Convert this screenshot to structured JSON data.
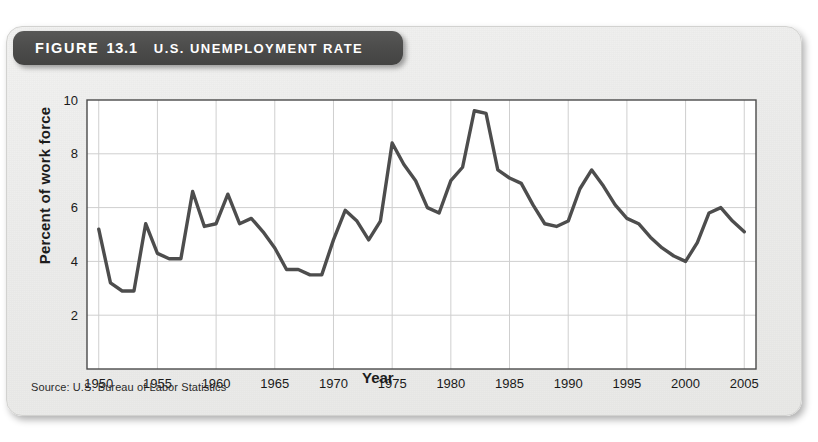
{
  "figure": {
    "banner_label": "FIGURE",
    "banner_number": "13.1",
    "banner_title": "U.S. UNEMPLOYMENT RATE",
    "source_note": "Source: U.S. Bureau of Labor Statistics",
    "banner_bg_color": "#4a4a49",
    "banner_text_color": "#ffffff",
    "card_bg_color": "#ececeb",
    "line_color": "#4d4d4d",
    "grid_color": "#cfcfcf",
    "axis_color": "#4a4a4a"
  },
  "chart_data": {
    "type": "line",
    "title": "U.S. UNEMPLOYMENT RATE",
    "xlabel": "Year",
    "ylabel": "Percent of work force",
    "xlim": [
      1949,
      2006
    ],
    "ylim": [
      0,
      10
    ],
    "yticks": [
      2,
      4,
      6,
      8,
      10
    ],
    "xticks": [
      1950,
      1955,
      1960,
      1965,
      1970,
      1975,
      1980,
      1985,
      1990,
      1995,
      2000,
      2005
    ],
    "grid": true,
    "legend": "none",
    "series": [
      {
        "name": "U.S. unemployment rate",
        "x": [
          1950,
          1951,
          1952,
          1953,
          1954,
          1955,
          1956,
          1957,
          1958,
          1959,
          1960,
          1961,
          1962,
          1963,
          1964,
          1965,
          1966,
          1967,
          1968,
          1969,
          1970,
          1971,
          1972,
          1973,
          1974,
          1975,
          1976,
          1977,
          1978,
          1979,
          1980,
          1981,
          1982,
          1983,
          1984,
          1985,
          1986,
          1987,
          1988,
          1989,
          1990,
          1991,
          1992,
          1993,
          1994,
          1995,
          1996,
          1997,
          1998,
          1999,
          2000,
          2001,
          2002,
          2003,
          2004,
          2005
        ],
        "values": [
          5.2,
          3.2,
          2.9,
          2.9,
          5.4,
          4.3,
          4.1,
          4.1,
          6.6,
          5.3,
          5.4,
          6.5,
          5.4,
          5.6,
          5.1,
          4.5,
          3.7,
          3.7,
          3.5,
          3.5,
          4.8,
          5.9,
          5.5,
          4.8,
          5.5,
          8.4,
          7.6,
          7.0,
          6.0,
          5.8,
          7.0,
          7.5,
          9.6,
          9.5,
          7.4,
          7.1,
          6.9,
          6.1,
          5.4,
          5.3,
          5.5,
          6.7,
          7.4,
          6.8,
          6.1,
          5.6,
          5.4,
          4.9,
          4.5,
          4.2,
          4.0,
          4.7,
          5.8,
          6.0,
          5.5,
          5.1
        ]
      }
    ]
  }
}
